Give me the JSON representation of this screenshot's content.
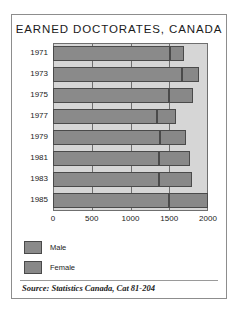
{
  "figure": {
    "title": "EARNED DOCTORATES, CANADA",
    "source": "Source: Statistics Canada, Cat 81-204"
  },
  "legend": {
    "items": [
      {
        "label": "Male",
        "color": "#8a8a8a"
      },
      {
        "label": "Female",
        "color": "#888888"
      }
    ]
  },
  "chart_data": {
    "type": "bar",
    "orientation": "horizontal",
    "stacked": true,
    "title": "EARNED DOCTORATES, CANADA",
    "xlabel": "",
    "ylabel": "",
    "xlim": [
      0,
      2000
    ],
    "xticks": [
      0,
      500,
      1000,
      1500,
      2000
    ],
    "xtick_labels": [
      "0",
      "500",
      "1000",
      "1500",
      "2000"
    ],
    "grid": true,
    "legend_position": "below-left",
    "categories": [
      "1971",
      "1973",
      "1975",
      "1977",
      "1979",
      "1981",
      "1983",
      "1985"
    ],
    "series": [
      {
        "name": "Male",
        "color": "#8a8a8a",
        "values": [
          1510,
          1660,
          1500,
          1340,
          1380,
          1370,
          1370,
          1500
        ]
      },
      {
        "name": "Female",
        "color": "#888888",
        "values": [
          180,
          220,
          300,
          250,
          330,
          400,
          420,
          500
        ]
      }
    ],
    "totals": [
      1690,
      1880,
      1800,
      1590,
      1710,
      1770,
      1790,
      2000
    ],
    "annotations": [
      "Source: Statistics Canada, Cat 81-204"
    ]
  }
}
